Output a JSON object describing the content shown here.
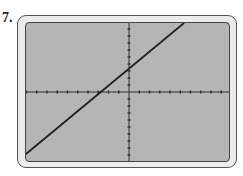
{
  "problem_number": "7.",
  "graph": {
    "window": {
      "xmin": -10,
      "xmax": 10,
      "ymin": -10,
      "ymax": 10,
      "xscl": 1,
      "yscl": 1
    },
    "equation": "y = x + 3",
    "colors": {
      "screen": "#b5b5b5",
      "axis": "#333333",
      "line": "#222222",
      "frame": "#ececec"
    }
  }
}
